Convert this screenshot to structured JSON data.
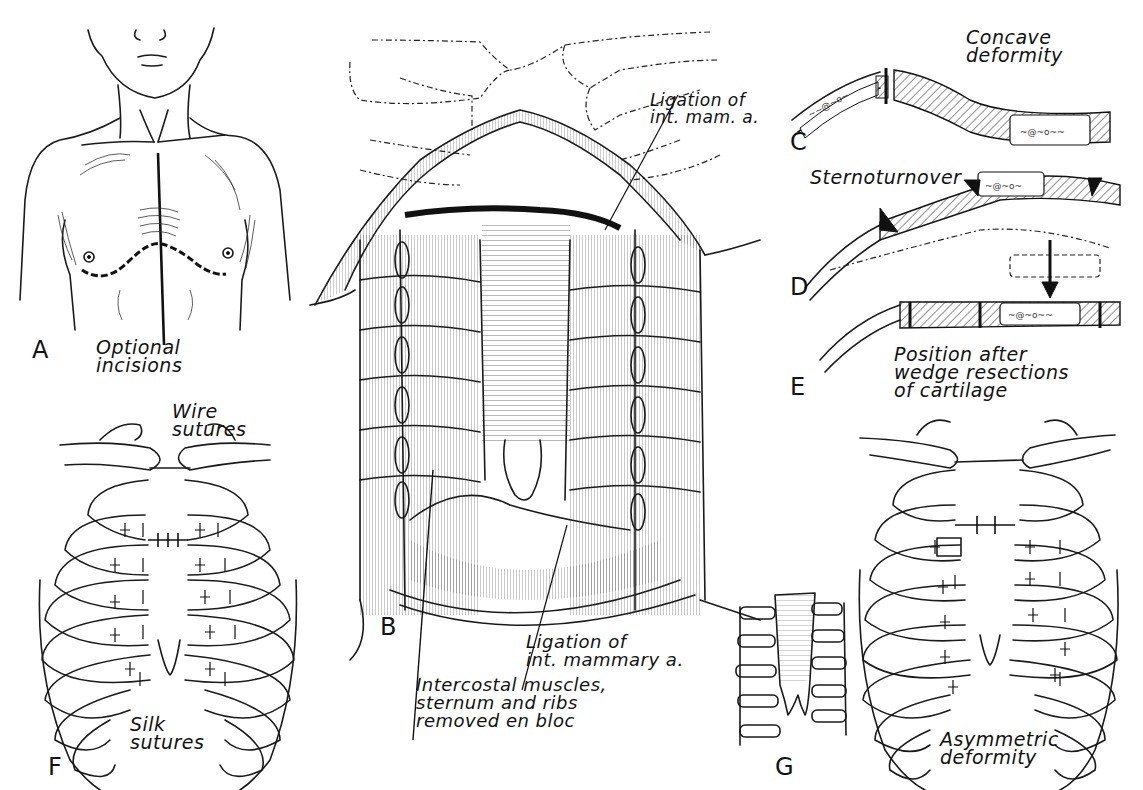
{
  "figure": {
    "panels": [
      {
        "id": "A",
        "letter": "A",
        "caption": "Optional\nincisions"
      },
      {
        "id": "B",
        "letter": "B",
        "callouts": [
          {
            "id": "ligation_top",
            "text": "Ligation of\nint. mam. a."
          },
          {
            "id": "ligation_bottom",
            "text": "Ligation of\nint. mammary a."
          },
          {
            "id": "en_bloc",
            "text": "Intercostal muscles,\nsternum and ribs\nremoved en bloc"
          }
        ]
      },
      {
        "id": "C",
        "letter": "C",
        "caption": "Concave\ndeformity"
      },
      {
        "id": "D",
        "letter": "D",
        "caption": "Sternoturnover"
      },
      {
        "id": "E",
        "letter": "E",
        "caption": "Position after\nwedge resections\nof cartilage"
      },
      {
        "id": "F",
        "letter": "F",
        "callouts": [
          {
            "id": "wire",
            "text": "Wire\nsutures"
          },
          {
            "id": "silk",
            "text": "Silk\nsutures"
          }
        ]
      },
      {
        "id": "G",
        "letter": "G"
      },
      {
        "id": "asym",
        "caption": "Asymmetric\ndeformity"
      }
    ]
  }
}
